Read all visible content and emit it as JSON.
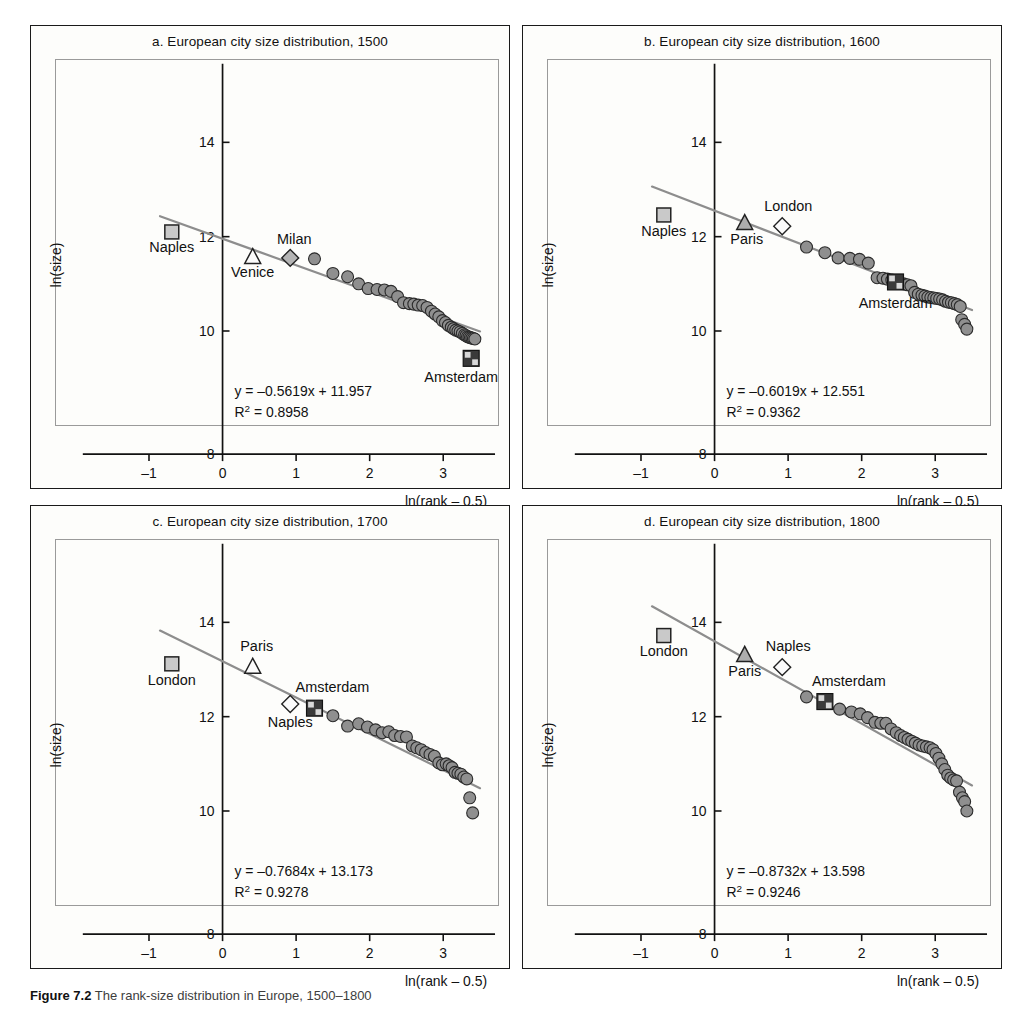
{
  "figure": {
    "caption_number": "Figure 7.2",
    "caption_text": "The rank-size distribution in Europe, 1500–1800"
  },
  "axes_common": {
    "xlabel": "ln(rank – 0.5)",
    "ylabel": "ln(size)",
    "xticks": [
      "-1",
      "0",
      "1",
      "2",
      "3"
    ],
    "yticks": [
      "8",
      "10",
      "12",
      "14"
    ],
    "xlim": [
      -1.25,
      3.65
    ],
    "ylim": [
      7.6,
      15.2
    ],
    "grid": false
  },
  "colors": {
    "point_fill": "#8f8f8f",
    "point_stroke": "#2b2b2b",
    "fit_line": "#8d8d8d",
    "frame": "#1a1a1a",
    "plot_frame": "#9a9a9a",
    "text": "#111111",
    "page_bg": "#ffffff"
  },
  "chart_data": [
    {
      "id": "a",
      "type": "scatter",
      "title": "a. European city size distribution, 1500",
      "xlabel": "ln(rank – 0.5)",
      "ylabel": "ln(size)",
      "xlim": [
        -1.25,
        3.65
      ],
      "ylim": [
        7.6,
        15.2
      ],
      "xticks": [
        -1,
        0,
        1,
        2,
        3
      ],
      "yticks": [
        8,
        10,
        12,
        14
      ],
      "grid": false,
      "legend_position": "none",
      "fit": {
        "slope": -0.5619,
        "intercept": 11.957,
        "r2": 0.8958,
        "equation_text": "y = –0.5619x + 11.957",
        "r2_text": "R² = 0.8958",
        "x_from": -0.85,
        "x_to": 3.5
      },
      "annotations": [
        {
          "label": "Naples",
          "marker": "square-light",
          "x": -0.69,
          "y": 12.1,
          "label_dx": 0,
          "label_dy": 20
        },
        {
          "label": "Venice",
          "marker": "triangle-open",
          "x": 0.41,
          "y": 11.58,
          "label_dx": 0,
          "label_dy": 21
        },
        {
          "label": "Milan",
          "marker": "diamond-gray",
          "x": 0.92,
          "y": 11.55,
          "label_dx": 4,
          "label_dy": -14
        },
        {
          "label": "Amsterdam",
          "marker": "check-square",
          "x": 3.38,
          "y": 9.42,
          "label_dx": -10,
          "label_dy": 24
        }
      ],
      "points": [
        {
          "x": 1.25,
          "y": 11.53
        },
        {
          "x": 1.5,
          "y": 11.22
        },
        {
          "x": 1.7,
          "y": 11.15
        },
        {
          "x": 1.85,
          "y": 11.0
        },
        {
          "x": 1.98,
          "y": 10.9
        },
        {
          "x": 2.1,
          "y": 10.88
        },
        {
          "x": 2.2,
          "y": 10.87
        },
        {
          "x": 2.29,
          "y": 10.84
        },
        {
          "x": 2.38,
          "y": 10.73
        },
        {
          "x": 2.46,
          "y": 10.6
        },
        {
          "x": 2.54,
          "y": 10.58
        },
        {
          "x": 2.6,
          "y": 10.57
        },
        {
          "x": 2.66,
          "y": 10.55
        },
        {
          "x": 2.72,
          "y": 10.54
        },
        {
          "x": 2.78,
          "y": 10.5
        },
        {
          "x": 2.84,
          "y": 10.42
        },
        {
          "x": 2.89,
          "y": 10.36
        },
        {
          "x": 2.94,
          "y": 10.3
        },
        {
          "x": 2.99,
          "y": 10.22
        },
        {
          "x": 3.03,
          "y": 10.18
        },
        {
          "x": 3.07,
          "y": 10.12
        },
        {
          "x": 3.11,
          "y": 10.08
        },
        {
          "x": 3.14,
          "y": 10.05
        },
        {
          "x": 3.17,
          "y": 10.02
        },
        {
          "x": 3.2,
          "y": 10.0
        },
        {
          "x": 3.23,
          "y": 9.98
        },
        {
          "x": 3.26,
          "y": 9.95
        },
        {
          "x": 3.29,
          "y": 9.92
        },
        {
          "x": 3.31,
          "y": 9.9
        },
        {
          "x": 3.33,
          "y": 9.88
        },
        {
          "x": 3.35,
          "y": 9.87
        },
        {
          "x": 3.37,
          "y": 9.86
        },
        {
          "x": 3.39,
          "y": 9.85
        },
        {
          "x": 3.41,
          "y": 9.84
        },
        {
          "x": 3.43,
          "y": 9.83
        }
      ]
    },
    {
      "id": "b",
      "type": "scatter",
      "title": "b. European city size distribution, 1600",
      "xlabel": "ln(rank – 0.5)",
      "ylabel": "ln(size)",
      "xlim": [
        -1.25,
        3.65
      ],
      "ylim": [
        7.6,
        15.2
      ],
      "xticks": [
        -1,
        0,
        1,
        2,
        3
      ],
      "yticks": [
        8,
        10,
        12,
        14
      ],
      "grid": false,
      "legend_position": "none",
      "fit": {
        "slope": -0.6019,
        "intercept": 12.551,
        "r2": 0.9362,
        "equation_text": "y = –0.6019x + 12.551",
        "r2_text": "R² = 0.9362",
        "x_from": -0.85,
        "x_to": 3.5
      },
      "annotations": [
        {
          "label": "Naples",
          "marker": "square-light",
          "x": -0.69,
          "y": 12.46,
          "label_dx": 0,
          "label_dy": 21
        },
        {
          "label": "Paris",
          "marker": "triangle-gray",
          "x": 0.41,
          "y": 12.3,
          "label_dx": 2,
          "label_dy": 22
        },
        {
          "label": "London",
          "marker": "diamond-open",
          "x": 0.92,
          "y": 12.22,
          "label_dx": 6,
          "label_dy": -15
        },
        {
          "label": "Amsterdam",
          "marker": "check-square",
          "x": 2.46,
          "y": 11.04,
          "label_dx": 0,
          "label_dy": 26
        }
      ],
      "points": [
        {
          "x": 1.25,
          "y": 11.78
        },
        {
          "x": 1.5,
          "y": 11.66
        },
        {
          "x": 1.68,
          "y": 11.55
        },
        {
          "x": 1.84,
          "y": 11.54
        },
        {
          "x": 1.97,
          "y": 11.52
        },
        {
          "x": 2.09,
          "y": 11.44
        },
        {
          "x": 2.21,
          "y": 11.13
        },
        {
          "x": 2.29,
          "y": 11.12
        },
        {
          "x": 2.35,
          "y": 11.1
        },
        {
          "x": 2.41,
          "y": 11.08
        },
        {
          "x": 2.52,
          "y": 11.02
        },
        {
          "x": 2.57,
          "y": 11.0
        },
        {
          "x": 2.62,
          "y": 10.98
        },
        {
          "x": 2.67,
          "y": 10.96
        },
        {
          "x": 2.72,
          "y": 10.82
        },
        {
          "x": 2.77,
          "y": 10.78
        },
        {
          "x": 2.82,
          "y": 10.76
        },
        {
          "x": 2.86,
          "y": 10.74
        },
        {
          "x": 2.9,
          "y": 10.72
        },
        {
          "x": 2.94,
          "y": 10.71
        },
        {
          "x": 2.98,
          "y": 10.7
        },
        {
          "x": 3.02,
          "y": 10.69
        },
        {
          "x": 3.06,
          "y": 10.68
        },
        {
          "x": 3.1,
          "y": 10.66
        },
        {
          "x": 3.14,
          "y": 10.63
        },
        {
          "x": 3.18,
          "y": 10.61
        },
        {
          "x": 3.22,
          "y": 10.6
        },
        {
          "x": 3.26,
          "y": 10.58
        },
        {
          "x": 3.3,
          "y": 10.56
        },
        {
          "x": 3.34,
          "y": 10.52
        },
        {
          "x": 3.36,
          "y": 10.24
        },
        {
          "x": 3.4,
          "y": 10.14
        },
        {
          "x": 3.43,
          "y": 10.04
        }
      ]
    },
    {
      "id": "c",
      "type": "scatter",
      "title": "c. European city size distribution, 1700",
      "xlabel": "ln(rank – 0.5)",
      "ylabel": "ln(size)",
      "xlim": [
        -1.25,
        3.65
      ],
      "ylim": [
        7.6,
        15.2
      ],
      "xticks": [
        -1,
        0,
        1,
        2,
        3
      ],
      "yticks": [
        8,
        10,
        12,
        14
      ],
      "grid": false,
      "legend_position": "none",
      "fit": {
        "slope": -0.7684,
        "intercept": 13.173,
        "r2": 0.9278,
        "equation_text": "y = –0.7684x + 13.173",
        "r2_text": "R² = 0.9278",
        "x_from": -0.85,
        "x_to": 3.5
      },
      "annotations": [
        {
          "label": "London",
          "marker": "square-light",
          "x": -0.69,
          "y": 13.12,
          "label_dx": 0,
          "label_dy": 21
        },
        {
          "label": "Paris",
          "marker": "triangle-open",
          "x": 0.41,
          "y": 13.07,
          "label_dx": 4,
          "label_dy": -15
        },
        {
          "label": "Naples",
          "marker": "diamond-open",
          "x": 0.92,
          "y": 12.27,
          "label_dx": 0,
          "label_dy": 23
        },
        {
          "label": "Amsterdam",
          "marker": "check-square",
          "x": 1.25,
          "y": 12.18,
          "label_dx": 18,
          "label_dy": -16
        }
      ],
      "points": [
        {
          "x": 1.5,
          "y": 12.02
        },
        {
          "x": 1.7,
          "y": 11.8
        },
        {
          "x": 1.85,
          "y": 11.85
        },
        {
          "x": 1.97,
          "y": 11.78
        },
        {
          "x": 2.08,
          "y": 11.72
        },
        {
          "x": 2.17,
          "y": 11.66
        },
        {
          "x": 2.26,
          "y": 11.68
        },
        {
          "x": 2.34,
          "y": 11.6
        },
        {
          "x": 2.42,
          "y": 11.58
        },
        {
          "x": 2.5,
          "y": 11.57
        },
        {
          "x": 2.58,
          "y": 11.38
        },
        {
          "x": 2.64,
          "y": 11.34
        },
        {
          "x": 2.7,
          "y": 11.3
        },
        {
          "x": 2.76,
          "y": 11.24
        },
        {
          "x": 2.82,
          "y": 11.2
        },
        {
          "x": 2.88,
          "y": 11.16
        },
        {
          "x": 2.94,
          "y": 11.02
        },
        {
          "x": 2.99,
          "y": 10.98
        },
        {
          "x": 3.04,
          "y": 11.0
        },
        {
          "x": 3.08,
          "y": 10.96
        },
        {
          "x": 3.12,
          "y": 10.92
        },
        {
          "x": 3.16,
          "y": 10.82
        },
        {
          "x": 3.2,
          "y": 10.8
        },
        {
          "x": 3.24,
          "y": 10.78
        },
        {
          "x": 3.28,
          "y": 10.72
        },
        {
          "x": 3.32,
          "y": 10.68
        },
        {
          "x": 3.36,
          "y": 10.28
        },
        {
          "x": 3.4,
          "y": 9.96
        }
      ]
    },
    {
      "id": "d",
      "type": "scatter",
      "title": "d. European city size distribution, 1800",
      "xlabel": "ln(rank – 0.5)",
      "ylabel": "ln(size)",
      "xlim": [
        -1.25,
        3.65
      ],
      "ylim": [
        7.6,
        15.2
      ],
      "xticks": [
        -1,
        0,
        1,
        2,
        3
      ],
      "yticks": [
        8,
        10,
        12,
        14
      ],
      "grid": false,
      "legend_position": "none",
      "fit": {
        "slope": -0.8732,
        "intercept": 13.598,
        "r2": 0.9246,
        "equation_text": "y = –0.8732x + 13.598",
        "r2_text": "R² = 0.9246",
        "x_from": -0.85,
        "x_to": 3.5
      },
      "annotations": [
        {
          "label": "London",
          "marker": "square-light",
          "x": -0.69,
          "y": 13.72,
          "label_dx": 0,
          "label_dy": 21
        },
        {
          "label": "Paris",
          "marker": "triangle-gray",
          "x": 0.41,
          "y": 13.32,
          "label_dx": 0,
          "label_dy": 22
        },
        {
          "label": "Naples",
          "marker": "diamond-open",
          "x": 0.92,
          "y": 13.05,
          "label_dx": 6,
          "label_dy": -16
        },
        {
          "label": "Amsterdam",
          "marker": "check-square",
          "x": 1.5,
          "y": 12.32,
          "label_dx": 24,
          "label_dy": -16
        }
      ],
      "points": [
        {
          "x": 1.25,
          "y": 12.42
        },
        {
          "x": 1.7,
          "y": 12.16
        },
        {
          "x": 1.86,
          "y": 12.1
        },
        {
          "x": 1.98,
          "y": 12.06
        },
        {
          "x": 2.08,
          "y": 11.98
        },
        {
          "x": 2.18,
          "y": 11.88
        },
        {
          "x": 2.26,
          "y": 11.86
        },
        {
          "x": 2.33,
          "y": 11.86
        },
        {
          "x": 2.4,
          "y": 11.74
        },
        {
          "x": 2.47,
          "y": 11.66
        },
        {
          "x": 2.53,
          "y": 11.6
        },
        {
          "x": 2.58,
          "y": 11.56
        },
        {
          "x": 2.63,
          "y": 11.52
        },
        {
          "x": 2.68,
          "y": 11.48
        },
        {
          "x": 2.73,
          "y": 11.44
        },
        {
          "x": 2.78,
          "y": 11.4
        },
        {
          "x": 2.83,
          "y": 11.38
        },
        {
          "x": 2.88,
          "y": 11.36
        },
        {
          "x": 2.93,
          "y": 11.34
        },
        {
          "x": 2.97,
          "y": 11.3
        },
        {
          "x": 3.01,
          "y": 11.22
        },
        {
          "x": 3.05,
          "y": 11.12
        },
        {
          "x": 3.09,
          "y": 11.0
        },
        {
          "x": 3.13,
          "y": 10.88
        },
        {
          "x": 3.17,
          "y": 10.76
        },
        {
          "x": 3.21,
          "y": 10.7
        },
        {
          "x": 3.25,
          "y": 10.66
        },
        {
          "x": 3.29,
          "y": 10.64
        },
        {
          "x": 3.33,
          "y": 10.4
        },
        {
          "x": 3.37,
          "y": 10.28
        },
        {
          "x": 3.4,
          "y": 10.2
        },
        {
          "x": 3.43,
          "y": 10.0
        }
      ]
    }
  ]
}
